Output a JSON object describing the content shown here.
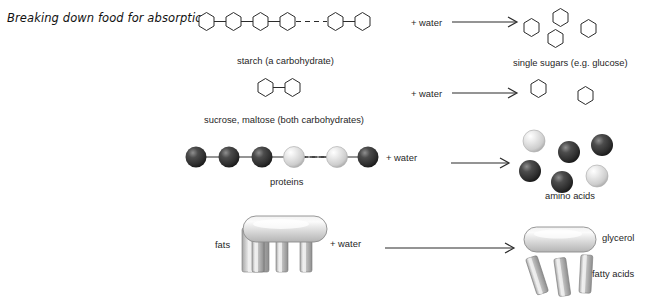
{
  "title": "Breaking down food for absorption.",
  "reaction_label": "+ water",
  "rows": [
    {
      "id": "starch",
      "reactant_label": "starch (a carbohydrate)",
      "product_label": "single sugars (e.g. glucose)",
      "reactant_type": "hexagon-chain",
      "product_type": "hexagons-scattered",
      "reactant_units": 6,
      "product_units": 4,
      "plus_water": "+ water"
    },
    {
      "id": "disaccharides",
      "reactant_label": "sucrose, maltose (both carbohydrates)",
      "product_label": "",
      "reactant_type": "hexagon-pair",
      "product_type": "hexagons-scattered",
      "reactant_units": 2,
      "product_units": 2,
      "plus_water": "+ water"
    },
    {
      "id": "proteins",
      "reactant_label": "proteins",
      "product_label": "amino acids",
      "reactant_type": "sphere-chain",
      "product_type": "spheres-scattered",
      "reactant_units": 6,
      "product_units": 6,
      "plus_water": "+ water"
    },
    {
      "id": "fats",
      "reactant_label": "fats",
      "product_label_glycerol": "glycerol",
      "product_label_fatty_acids": "fatty acids",
      "reactant_type": "fat-molecule",
      "product_type": "glycerol-and-fatty-acids",
      "plus_water": "+ water"
    }
  ],
  "colors": {
    "stroke": "#2b2b2b",
    "background": "#ffffff",
    "sphere_dark": "#3a3a3a",
    "sphere_light": "#d8d8d8",
    "fat_body": "#cfcfcf",
    "text": "#1f1f1f"
  }
}
